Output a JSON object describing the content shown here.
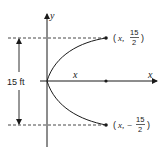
{
  "diagram": {
    "type": "parabola-cross-section",
    "axes": {
      "x_label": "x",
      "y_label": "y"
    },
    "dimension": {
      "label": "15 ft"
    },
    "segment_label": "x",
    "points": {
      "upper": {
        "open": "(",
        "x": "x,",
        "num": "15",
        "den": "2",
        "close": ")"
      },
      "lower": {
        "open": "(",
        "x": "x, −",
        "num": "15",
        "den": "2",
        "close": ")"
      }
    },
    "colors": {
      "line": "#1a1a1a",
      "background": "#ffffff"
    }
  }
}
